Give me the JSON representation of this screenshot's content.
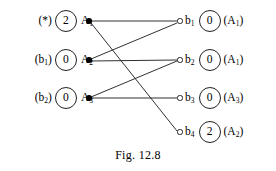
{
  "figure": {
    "caption": "Fig. 12.8",
    "type": "bipartite-matching-diagram",
    "ink_color": "#000000",
    "background_color": "#ffffff"
  },
  "left_nodes": [
    {
      "id": "A1",
      "prefix_label": "(*)",
      "prefix_plain": "(*)",
      "value": "2",
      "name": "A",
      "subscript": "1",
      "x": 89,
      "y": 21,
      "marker": "filled-dot"
    },
    {
      "id": "A2",
      "prefix_label": "(b",
      "prefix_sub": "1",
      "prefix_suffix": ")",
      "prefix_plain": "(b1)",
      "value": "0",
      "name": "A",
      "subscript": "2",
      "x": 89,
      "y": 60,
      "marker": "filled-dot"
    },
    {
      "id": "A3",
      "prefix_label": "(b",
      "prefix_sub": "2",
      "prefix_suffix": ")",
      "prefix_plain": "(b2)",
      "value": "0",
      "name": "A",
      "subscript": "3",
      "x": 89,
      "y": 98,
      "marker": "filled-dot"
    }
  ],
  "right_nodes": [
    {
      "id": "b1",
      "name": "b",
      "subscript": "1",
      "value": "0",
      "suffix_open": "(A",
      "suffix_sub": "1",
      "suffix_close": ")",
      "suffix_plain": "(A1)",
      "x": 180,
      "y": 21,
      "marker": "open-circle"
    },
    {
      "id": "b2",
      "name": "b",
      "subscript": "2",
      "value": "0",
      "suffix_open": "(A",
      "suffix_sub": "1",
      "suffix_close": ")",
      "suffix_plain": "(A1)",
      "x": 180,
      "y": 60,
      "marker": "open-circle"
    },
    {
      "id": "b3",
      "name": "b",
      "subscript": "3",
      "value": "0",
      "suffix_open": "(A",
      "suffix_sub": "3",
      "suffix_close": ")",
      "suffix_plain": "(A3)",
      "x": 180,
      "y": 98,
      "marker": "open-circle"
    },
    {
      "id": "b4",
      "name": "b",
      "subscript": "4",
      "value": "2",
      "suffix_open": "(A",
      "suffix_sub": "2",
      "suffix_close": ")",
      "suffix_plain": "(A2)",
      "x": 180,
      "y": 132,
      "marker": "open-circle"
    }
  ],
  "edges": [
    {
      "from": "A1",
      "to": "b1",
      "x1": 91,
      "y1": 21,
      "x2": 177,
      "y2": 21
    },
    {
      "from": "A1",
      "to": "b4",
      "x1": 91,
      "y1": 23,
      "x2": 177,
      "y2": 131
    },
    {
      "from": "A2",
      "to": "b1",
      "x1": 91,
      "y1": 59,
      "x2": 177,
      "y2": 23
    },
    {
      "from": "A2",
      "to": "b2",
      "x1": 91,
      "y1": 61,
      "x2": 177,
      "y2": 60
    },
    {
      "from": "A3",
      "to": "b2",
      "x1": 91,
      "y1": 97,
      "x2": 177,
      "y2": 61
    },
    {
      "from": "A3",
      "to": "b3",
      "x1": 91,
      "y1": 98,
      "x2": 177,
      "y2": 98
    }
  ]
}
